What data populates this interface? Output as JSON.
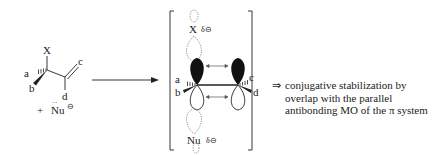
{
  "reactant": {
    "leaving_group": "X",
    "substituents": [
      "a",
      "b",
      "c",
      "d"
    ],
    "nucleophile_prefix": "+",
    "nucleophile": "Nu",
    "nucleophile_charge": "⊖",
    "lone_pair": "··"
  },
  "transition_state": {
    "top_label": "X",
    "top_charge": "δ⊖",
    "bottom_label": "Nu",
    "bottom_charge": "δ⊖",
    "substituents": [
      "a",
      "b",
      "c",
      "d"
    ]
  },
  "annotation": {
    "arrow": "⇒",
    "lines": [
      "conjugative stabilization by",
      "overlap with the parallel",
      "antibonding MO of the π system"
    ]
  },
  "colors": {
    "ink": "#222222",
    "dotted": "#777777",
    "background": "#ffffff"
  }
}
